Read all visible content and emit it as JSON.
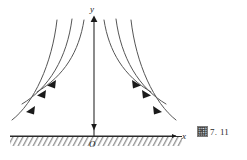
{
  "figure": {
    "caption_glyph": "图",
    "caption_text": "7. 11",
    "axis": {
      "y_label": "y",
      "x_label": "x",
      "origin_label": "O"
    },
    "colors": {
      "curve": "#555555",
      "axis": "#2b2b2b",
      "hatch": "#6e6e6e",
      "background": "#ffffff",
      "arrow": "#1a1a1a"
    }
  },
  "chart_data": {
    "type": "line",
    "title": "",
    "subtitle": "",
    "xlabel": "x",
    "ylabel": "y",
    "grid": false,
    "legend": "none",
    "axis_ranges": {
      "x_axis_y_pixel": 136,
      "y_axis_x_pixel": 94,
      "x_axis_from": 10,
      "x_axis_to": 182,
      "y_axis_from_top": 18
    },
    "origin_px": {
      "x": 94,
      "y": 136
    },
    "series": [
      {
        "name": "left-curve-1",
        "side": "left",
        "path": "M 84,20 C 79,52 64,76 37,92",
        "arrow_at": {
          "x": 50,
          "y": 84,
          "angle": 208
        }
      },
      {
        "name": "left-curve-2",
        "side": "left",
        "path": "M 72,19 C 67,58 49,88 22,104",
        "arrow_at": {
          "x": 40,
          "y": 94,
          "angle": 210
        }
      },
      {
        "name": "left-curve-3",
        "side": "left",
        "path": "M 57,20 C 52,64 34,103 12,120",
        "arrow_at": {
          "x": 29,
          "y": 110,
          "angle": 214
        }
      },
      {
        "name": "right-curve-1",
        "side": "right",
        "path": "M 104,20 C 109,52 124,76 151,92",
        "arrow_at": {
          "x": 138,
          "y": 84,
          "angle": 332
        }
      },
      {
        "name": "right-curve-2",
        "side": "right",
        "path": "M 116,19 C 121,58 139,88 166,104",
        "arrow_at": {
          "x": 148,
          "y": 94,
          "angle": 330
        }
      },
      {
        "name": "right-curve-3",
        "side": "right",
        "path": "M 131,20 C 136,64 154,103 176,120",
        "arrow_at": {
          "x": 159,
          "y": 110,
          "angle": 326
        }
      },
      {
        "name": "y-axis-flow",
        "side": "center",
        "path": "M 94,18 L 94,136",
        "arrow_at": {
          "x": 94,
          "y": 120,
          "angle": 90
        }
      }
    ]
  }
}
